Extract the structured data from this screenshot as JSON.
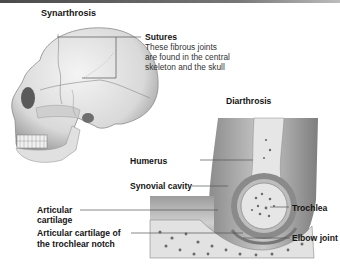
{
  "colors": {
    "top_bar": "#555555",
    "leader_line": "#555555",
    "bone": "#e6e6e6",
    "cartilage": "#8a8a8a",
    "muscle": "#a8a8a8"
  },
  "synarthrosis": {
    "title": "Synarthrosis",
    "callout": {
      "label": "Sutures",
      "description_lines": [
        "These fibrous joints",
        "are found in the central",
        "skeleton and the skull"
      ]
    }
  },
  "diarthrosis": {
    "title": "Diarthrosis",
    "labels": {
      "humerus": "Humerus",
      "synovial_cavity": "Synovial cavity",
      "articular_cartilage_1": "Articular",
      "articular_cartilage_2": "cartilage",
      "articular_notch_1": "Articular cartilage of",
      "articular_notch_2": "the trochlear notch",
      "trochlea": "Trochlea",
      "elbow_joint": "Elbow joint"
    }
  }
}
